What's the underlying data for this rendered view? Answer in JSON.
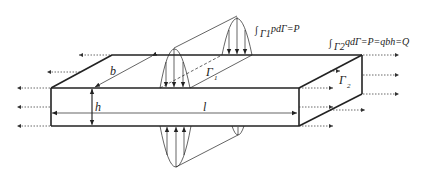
{
  "diagram": {
    "type": "3d-plate-with-distributed-loads",
    "labels": {
      "length": "l",
      "width": "b",
      "height": "h",
      "gamma1": "Γ",
      "gamma1_sub": "1",
      "gamma2": "Γ",
      "gamma2_sub": "2"
    },
    "equations": {
      "top_integral_sign": "∫",
      "top_sub": "Γ1",
      "top_body": "pdΓ=P",
      "right_integral_sign": "∫",
      "right_sub": "Γ2",
      "right_body": "qdΓ=P=qbh=Q"
    },
    "colors": {
      "stroke": "#222222",
      "dotted": "#444444",
      "background": "#ffffff"
    }
  }
}
